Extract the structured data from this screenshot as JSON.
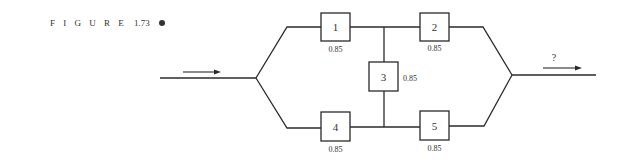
{
  "figure": {
    "label": "F I G U R E",
    "number": "1.73"
  },
  "diagram": {
    "type": "reliability-block-diagram",
    "output_label": "?",
    "components": [
      {
        "id": "1",
        "label": "1",
        "reliability": "0.85"
      },
      {
        "id": "2",
        "label": "2",
        "reliability": "0.85"
      },
      {
        "id": "3",
        "label": "3",
        "reliability": "0.85"
      },
      {
        "id": "4",
        "label": "4",
        "reliability": "0.85"
      },
      {
        "id": "5",
        "label": "5",
        "reliability": "0.85"
      }
    ]
  }
}
